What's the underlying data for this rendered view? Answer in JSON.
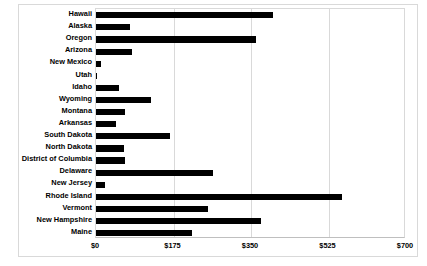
{
  "chart_data": {
    "type": "bar",
    "orientation": "horizontal",
    "title": "",
    "subtitle": "",
    "xlabel": "",
    "ylabel": "",
    "xlim": [
      0,
      700
    ],
    "ylim": null,
    "grid": true,
    "gridlines_axis": "x",
    "legend": false,
    "legend_position": "none",
    "xticks": [
      0,
      175,
      350,
      525,
      700
    ],
    "xtick_labels": [
      "$0",
      "$175",
      "$350",
      "$525",
      "$700"
    ],
    "bar_color": "#000000",
    "categories": [
      "Hawaii",
      "Alaska",
      "Oregon",
      "Arizona",
      "New Mexico",
      "Utah",
      "Idaho",
      "Wyoming",
      "Montana",
      "Arkansas",
      "South Dakota",
      "North Dakota",
      "District of Columbia",
      "Delaware",
      "New Jersey",
      "Rhode Island",
      "Vermont",
      "New Hampshire",
      "Maine"
    ],
    "values": [
      400,
      77,
      362,
      82,
      12,
      2,
      53,
      125,
      65,
      46,
      166,
      63,
      65,
      264,
      20,
      556,
      253,
      373,
      217
    ]
  },
  "axis": {
    "tick_0": "$0",
    "tick_1": "$175",
    "tick_2": "$350",
    "tick_3": "$525",
    "tick_4": "$700"
  }
}
